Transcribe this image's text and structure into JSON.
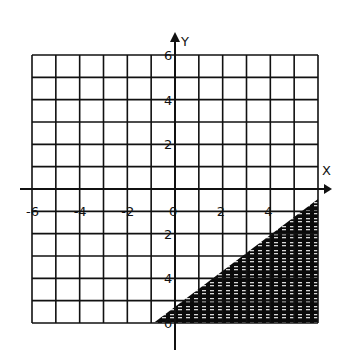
{
  "chart_data": {
    "type": "area",
    "title": "",
    "xlabel": "X",
    "ylabel": "Y",
    "xlim": [
      -6,
      6
    ],
    "ylim": [
      -6,
      6
    ],
    "grid": true,
    "grid_step": 1,
    "x_tick_labels": [
      {
        "value": -6,
        "label": "-6"
      },
      {
        "value": -4,
        "label": "-4"
      },
      {
        "value": -2,
        "label": "-2"
      },
      {
        "value": 0,
        "label": "0"
      },
      {
        "value": 2,
        "label": "2"
      },
      {
        "value": 4,
        "label": "4"
      }
    ],
    "y_tick_labels": [
      {
        "value": 6,
        "label": "6"
      },
      {
        "value": 4,
        "label": "4"
      },
      {
        "value": 2,
        "label": "2"
      },
      {
        "value": -2,
        "label": "2"
      },
      {
        "value": -4,
        "label": "4"
      },
      {
        "value": -6,
        "label": "0"
      }
    ],
    "shaded_region": {
      "description": "Region below/right of boundary line, shaded dark with dotted texture",
      "boundary_line": {
        "x1": -0.9,
        "y1": -6,
        "x2": 6,
        "y2": -0.45
      },
      "approx_equation": "y < 0.8x - 5.3"
    },
    "colors": {
      "grid": "#111111",
      "shade": "#0a0a0a",
      "background": "#ffffff"
    }
  }
}
